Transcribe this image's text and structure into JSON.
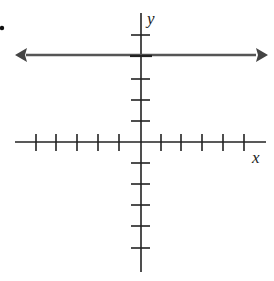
{
  "diagram": {
    "type": "coordinate-plane",
    "bullet": "•",
    "x_axis": {
      "label": "x",
      "ticks_left": 5,
      "ticks_right": 5
    },
    "y_axis": {
      "label": "y",
      "ticks_up": 5,
      "ticks_down": 6
    },
    "line": {
      "kind": "horizontal",
      "equation": "y = 4",
      "y_value": 4,
      "arrows": "both"
    },
    "colors": {
      "axis": "#222222",
      "line": "#555555"
    }
  }
}
